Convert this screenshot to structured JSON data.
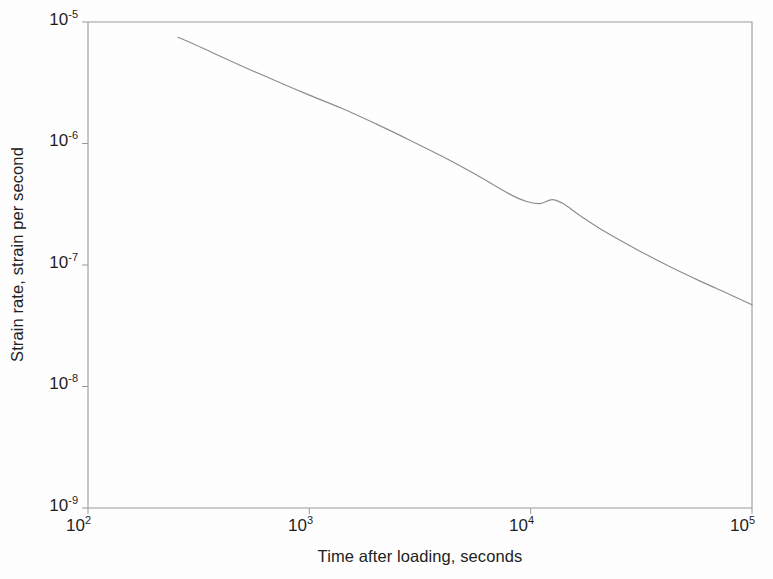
{
  "chart_data": {
    "type": "line",
    "title": "",
    "subtitle": "",
    "xlabel": "Time after loading, seconds",
    "ylabel": "Strain rate, strain per second",
    "xscale": "log",
    "yscale": "log",
    "xlim": [
      100,
      100000
    ],
    "ylim": [
      1e-09,
      1e-05
    ],
    "grid": false,
    "legend": null,
    "xticks": [
      {
        "value": 100,
        "label": "10",
        "exponent": "2"
      },
      {
        "value": 1000,
        "label": "10",
        "exponent": "3"
      },
      {
        "value": 10000,
        "label": "10",
        "exponent": "4"
      },
      {
        "value": 100000,
        "label": "10",
        "exponent": "5"
      }
    ],
    "yticks": [
      {
        "value": 1e-05,
        "label": "10",
        "exponent": "-5"
      },
      {
        "value": 1e-06,
        "label": "10",
        "exponent": "-6"
      },
      {
        "value": 1e-07,
        "label": "10",
        "exponent": "-7"
      },
      {
        "value": 1e-08,
        "label": "10",
        "exponent": "-8"
      },
      {
        "value": 1e-09,
        "label": "10",
        "exponent": "-9"
      }
    ],
    "series": [
      {
        "name": "strain rate",
        "color": "#8d8d8d",
        "x": [
          255,
          300,
          380,
          500,
          700,
          1000,
          1400,
          2000,
          2800,
          4000,
          5600,
          8000,
          9500,
          11000,
          12500,
          14000,
          17000,
          22000,
          30000,
          42000,
          58000,
          78000,
          100000
        ],
        "y": [
          7.5e-06,
          6.6e-06,
          5.4e-06,
          4.3e-06,
          3.3e-06,
          2.5e-06,
          1.95e-06,
          1.45e-06,
          1.08e-06,
          7.8e-07,
          5.6e-07,
          3.85e-07,
          3.35e-07,
          3.2e-07,
          3.45e-07,
          3.2e-07,
          2.5e-07,
          1.85e-07,
          1.35e-07,
          9.8e-08,
          7.4e-08,
          5.8e-08,
          4.7e-08
        ]
      }
    ],
    "annotations": []
  },
  "axes": {
    "frame_color": "#9a9a9a",
    "line_color": "#8d8d8d"
  }
}
